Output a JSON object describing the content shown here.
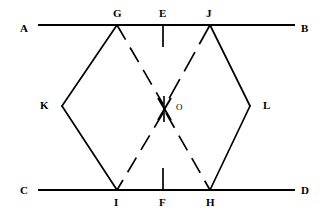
{
  "figure": {
    "width": 322,
    "height": 223,
    "background_color": "#ffffff",
    "stroke_color": "#000000"
  },
  "labels": {
    "A": "A",
    "B": "B",
    "C": "C",
    "D": "D",
    "E": "E",
    "F": "F",
    "G": "G",
    "H": "H",
    "I": "I",
    "J": "J",
    "K": "K",
    "L": "L",
    "O": "O"
  },
  "points": {
    "A": {
      "x": 20,
      "y": 29,
      "label": "A"
    },
    "B": {
      "x": 301,
      "y": 29,
      "label": "B"
    },
    "C": {
      "x": 20,
      "y": 191,
      "label": "C"
    },
    "D": {
      "x": 301,
      "y": 191,
      "label": "D"
    },
    "E": {
      "x": 163,
      "y": 15,
      "label": "E"
    },
    "F": {
      "x": 163,
      "y": 207,
      "label": "F"
    },
    "G": {
      "x": 117,
      "y": 15,
      "label": "G"
    },
    "H": {
      "x": 210,
      "y": 207,
      "label": "H"
    },
    "I": {
      "x": 117,
      "y": 207,
      "label": "I"
    },
    "J": {
      "x": 210,
      "y": 15,
      "label": "J"
    },
    "K": {
      "x": 44,
      "y": 105,
      "label": "K"
    },
    "L": {
      "x": 266,
      "y": 105,
      "label": "L"
    },
    "O": {
      "x": 175,
      "y": 108,
      "label": "O"
    }
  },
  "segments": {
    "line_AB": {
      "name": "line-ab",
      "style": "solid",
      "x1": 38,
      "y1": 25,
      "x2": 295,
      "y2": 25
    },
    "line_CD": {
      "name": "line-cd",
      "style": "solid",
      "x1": 38,
      "y1": 190,
      "x2": 295,
      "y2": 190
    },
    "tick_E": {
      "name": "tick-e",
      "style": "solid",
      "x1": 163,
      "y1": 25,
      "x2": 163,
      "y2": 47
    },
    "tick_F": {
      "name": "tick-f",
      "style": "solid",
      "x1": 163,
      "y1": 168,
      "x2": 163,
      "y2": 190
    },
    "side_GK": {
      "name": "side-gk",
      "style": "solid",
      "x1": 117,
      "y1": 25,
      "x2": 62,
      "y2": 106
    },
    "side_KI": {
      "name": "side-ki",
      "style": "solid",
      "x1": 62,
      "y1": 106,
      "x2": 117,
      "y2": 190
    },
    "side_JL": {
      "name": "side-jl",
      "style": "solid",
      "x1": 210,
      "y1": 25,
      "x2": 250,
      "y2": 106
    },
    "side_LH": {
      "name": "side-lh",
      "style": "solid",
      "x1": 250,
      "y1": 106,
      "x2": 210,
      "y2": 190
    },
    "diag_GO": {
      "name": "diagonal-g-o",
      "style": "dashed",
      "x1": 117,
      "y1": 25,
      "x2": 163,
      "y2": 104
    },
    "diag_OH": {
      "name": "diagonal-o-h",
      "style": "dashed",
      "x1": 166,
      "y1": 113,
      "x2": 210,
      "y2": 190
    },
    "diag_JO": {
      "name": "diagonal-j-o",
      "style": "dashed",
      "x1": 210,
      "y1": 25,
      "x2": 166,
      "y2": 104
    },
    "diag_OI": {
      "name": "diagonal-o-i",
      "style": "dashed",
      "x1": 163,
      "y1": 113,
      "x2": 117,
      "y2": 190
    },
    "center_tick": {
      "name": "center-tick-o",
      "style": "solid",
      "x1": 164,
      "y1": 96,
      "x2": 164,
      "y2": 122
    }
  }
}
